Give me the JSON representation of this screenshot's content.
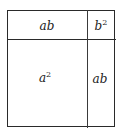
{
  "diagram": {
    "title": "",
    "regions": [
      {
        "name": "top-left",
        "label": "ab",
        "base": "ab",
        "exponent": ""
      },
      {
        "name": "top-right",
        "label": "b^2",
        "base": "b",
        "exponent": "2"
      },
      {
        "name": "bottom-left",
        "label": "a^2",
        "base": "a",
        "exponent": "2"
      },
      {
        "name": "bottom-right",
        "label": "ab",
        "base": "ab",
        "exponent": ""
      }
    ],
    "line_color": "#2a2a2a",
    "text_color": "#222222"
  }
}
